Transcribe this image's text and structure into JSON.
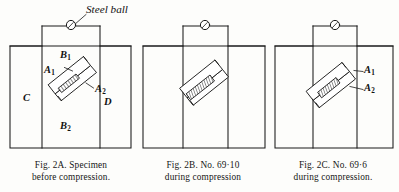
{
  "figure": {
    "annotation_label": "Steel ball",
    "panels": [
      {
        "id": "2A",
        "caption_lines": [
          "Fig. 2A.  Specimen",
          "before compression."
        ],
        "part_labels": [
          {
            "name": "B1",
            "base": "B",
            "sub": "1"
          },
          {
            "name": "A1",
            "base": "A",
            "sub": "1"
          },
          {
            "name": "A2",
            "base": "A",
            "sub": "2"
          },
          {
            "name": "C",
            "base": "C",
            "sub": ""
          },
          {
            "name": "D",
            "base": "D",
            "sub": ""
          },
          {
            "name": "B2",
            "base": "B",
            "sub": "2"
          }
        ]
      },
      {
        "id": "2B",
        "caption_lines": [
          "Fig. 2B.  No. 69·10",
          "during compression"
        ],
        "part_labels": []
      },
      {
        "id": "2C",
        "caption_lines": [
          "Fig. 2C.   No.  69·6",
          "during compression."
        ],
        "part_labels": [
          {
            "name": "A1",
            "base": "A",
            "sub": "1"
          },
          {
            "name": "A2",
            "base": "A",
            "sub": "2"
          }
        ]
      }
    ]
  },
  "colors": {
    "ink": "#1a1a1a",
    "paper": "#fdfdfb",
    "hatch": "#2b2b2b"
  }
}
